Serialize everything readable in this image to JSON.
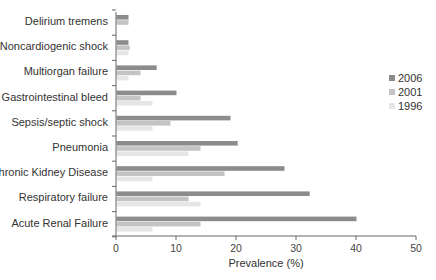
{
  "chart_data": {
    "type": "bar",
    "orientation": "horizontal",
    "title": "",
    "xlabel": "Prevalence (%)",
    "ylabel": "",
    "xlim": [
      0,
      50
    ],
    "xticks": [
      0,
      10,
      20,
      30,
      40,
      50
    ],
    "grid": false,
    "legend_position": "right",
    "categories": [
      "Delirium tremens",
      "Noncardiogenic shock",
      "Multiorgan failure",
      "Gastrointestinal bleed",
      "Sepsis/septic shock",
      "Pneumonia",
      "Chronic Kidney Disease",
      "Respiratory failure",
      "Acute Renal Failure"
    ],
    "series": [
      {
        "name": "2006",
        "color": "#8c8c8c",
        "values": [
          2,
          2,
          6.7,
          10,
          19,
          20.2,
          28,
          32.2,
          40
        ]
      },
      {
        "name": "2001",
        "color": "#c4c4c4",
        "values": [
          2,
          2.2,
          4,
          4,
          9,
          14,
          18,
          12,
          14
        ]
      },
      {
        "name": "1996",
        "color": "#e6e6e6",
        "values": [
          0,
          2,
          2,
          6,
          6,
          12,
          6,
          14,
          6
        ]
      }
    ]
  }
}
